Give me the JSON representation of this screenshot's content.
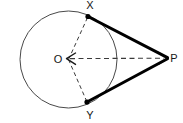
{
  "figure": {
    "canvas": {
      "width": 183,
      "height": 123,
      "background": "#ffffff"
    },
    "colors": {
      "circle_stroke": "#4a4a4a",
      "tangent_stroke": "#000000",
      "dashed_stroke": "#3a3a3a",
      "label_fill": "#161616",
      "point_fill": "#000000"
    },
    "circle": {
      "name": "circle-O",
      "center_label": "O",
      "cx": 68.5,
      "cy": 59.5,
      "r": 48.5,
      "stroke_width": 1
    },
    "points": [
      {
        "id": "X",
        "label": "X",
        "cx": 88,
        "cy": 16.5,
        "label_x": 90,
        "label_y": 9,
        "marker": true
      },
      {
        "id": "O",
        "label": "O",
        "cx": 68.5,
        "cy": 59.5,
        "label_x": 58,
        "label_y": 63,
        "marker": false
      },
      {
        "id": "Y",
        "label": "Y",
        "cx": 87,
        "cy": 102,
        "label_x": 90,
        "label_y": 119,
        "marker": true
      },
      {
        "id": "P",
        "label": "P",
        "cx": 168,
        "cy": 58,
        "label_x": 174,
        "label_y": 62,
        "marker": false
      }
    ],
    "segments": [
      {
        "id": "XP",
        "from": "X",
        "to": "P",
        "style": "solid-thick",
        "stroke_width": 3,
        "label": "tangent-segment-xp"
      },
      {
        "id": "YP",
        "from": "Y",
        "to": "P",
        "style": "solid-thick",
        "stroke_width": 3,
        "label": "tangent-segment-yp"
      },
      {
        "id": "OX",
        "from": "O",
        "to": "X",
        "style": "dashed",
        "stroke_width": 1,
        "label": "radius-ox"
      },
      {
        "id": "OY",
        "from": "O",
        "to": "Y",
        "style": "dashed",
        "stroke_width": 1,
        "label": "radius-oy"
      },
      {
        "id": "OP",
        "from": "O",
        "to": "P",
        "style": "dashed-double-arrow",
        "stroke_width": 1,
        "label": "axis-op"
      }
    ],
    "dash_pattern": "4 3",
    "arrowheads": {
      "op_left": true,
      "op_right": true
    }
  }
}
